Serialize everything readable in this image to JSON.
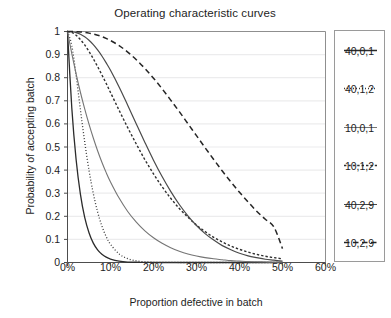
{
  "chart_data": {
    "type": "line",
    "title": "Operating characteristic curves",
    "xlabel": "Proportion defective in batch",
    "ylabel": "Probability of accepting batch",
    "xlim": [
      0,
      60
    ],
    "ylim": [
      0,
      1
    ],
    "grid": "horizontal",
    "legend_position": "right-outside",
    "xticks": [
      "0%",
      "10%",
      "20%",
      "30%",
      "40%",
      "50%",
      "60%"
    ],
    "xtick_values": [
      0,
      10,
      20,
      30,
      40,
      50,
      60
    ],
    "yticks": [
      "0",
      "0.1",
      "0.2",
      "0.3",
      "0.4",
      "0.5",
      "0.6",
      "0.7",
      "0.8",
      "0.9",
      "1"
    ],
    "ytick_values": [
      0,
      0.1,
      0.2,
      0.3,
      0.4,
      0.5,
      0.6,
      0.7,
      0.8,
      0.9,
      1
    ],
    "x": [
      0,
      1,
      2,
      3,
      4,
      5,
      6,
      7,
      8,
      9,
      10,
      12,
      14,
      16,
      18,
      20,
      22,
      24,
      26,
      28,
      30,
      32,
      34,
      36,
      38,
      40,
      42,
      44,
      46,
      48,
      50
    ],
    "series": [
      {
        "name": "40,0,1",
        "style": "solid",
        "color": "#2b2b2b",
        "width": 1.3,
        "values": [
          1.0,
          0.669,
          0.446,
          0.296,
          0.195,
          0.129,
          0.084,
          0.055,
          0.036,
          0.023,
          0.015,
          0.006,
          0.002,
          0.001,
          0.0004,
          0.0001,
          0.0,
          0.0,
          0.0,
          0.0,
          0.0,
          0.0,
          0.0,
          0.0,
          0.0,
          0.0,
          0.0,
          0.0,
          0.0,
          0.0,
          0.0
        ]
      },
      {
        "name": "40,1,2",
        "style": "dotted",
        "color": "#3a3a3a",
        "width": 1.3,
        "values": [
          1.0,
          0.939,
          0.81,
          0.662,
          0.522,
          0.399,
          0.299,
          0.219,
          0.158,
          0.112,
          0.079,
          0.037,
          0.017,
          0.007,
          0.003,
          0.001,
          0.0005,
          0.0002,
          0.0001,
          0.0,
          0.0,
          0.0,
          0.0,
          0.0,
          0.0,
          0.0,
          0.0,
          0.0,
          0.0,
          0.0,
          0.0
        ]
      },
      {
        "name": "10,0,1",
        "style": "solid",
        "color": "#757575",
        "width": 1.1,
        "values": [
          1.0,
          0.904,
          0.817,
          0.737,
          0.665,
          0.599,
          0.539,
          0.484,
          0.434,
          0.389,
          0.349,
          0.279,
          0.221,
          0.175,
          0.137,
          0.107,
          0.083,
          0.064,
          0.049,
          0.037,
          0.028,
          0.021,
          0.016,
          0.012,
          0.008,
          0.006,
          0.004,
          0.003,
          0.002,
          0.001,
          0.001
        ]
      },
      {
        "name": "10,1,2",
        "style": "dashed-fine",
        "color": "#2f2f2f",
        "width": 1.4,
        "values": [
          1.0,
          0.996,
          0.984,
          0.965,
          0.942,
          0.914,
          0.882,
          0.848,
          0.812,
          0.775,
          0.736,
          0.659,
          0.584,
          0.513,
          0.445,
          0.384,
          0.328,
          0.278,
          0.234,
          0.196,
          0.162,
          0.134,
          0.109,
          0.089,
          0.071,
          0.057,
          0.045,
          0.035,
          0.027,
          0.021,
          0.016
        ]
      },
      {
        "name": "40,2,9",
        "style": "solid",
        "color": "#4a4a4a",
        "width": 1.2,
        "values": [
          1.0,
          0.999,
          0.995,
          0.988,
          0.977,
          0.962,
          0.943,
          0.92,
          0.894,
          0.864,
          0.832,
          0.76,
          0.681,
          0.6,
          0.52,
          0.443,
          0.372,
          0.308,
          0.251,
          0.202,
          0.16,
          0.125,
          0.097,
          0.073,
          0.055,
          0.04,
          0.029,
          0.021,
          0.014,
          0.01,
          0.006
        ]
      },
      {
        "name": "10,2,9",
        "style": "dashed",
        "color": "#252525",
        "width": 1.5,
        "values": [
          1.0,
          1.0,
          0.999,
          0.998,
          0.996,
          0.993,
          0.989,
          0.984,
          0.978,
          0.97,
          0.961,
          0.939,
          0.911,
          0.878,
          0.84,
          0.798,
          0.752,
          0.703,
          0.653,
          0.601,
          0.549,
          0.497,
          0.446,
          0.396,
          0.349,
          0.304,
          0.262,
          0.222,
          0.187,
          0.154,
          0.06
        ]
      }
    ]
  },
  "legend": {
    "items": [
      {
        "label": "40,0,1"
      },
      {
        "label": "40,1,2"
      },
      {
        "label": "10,0,1"
      },
      {
        "label": "10,1,2"
      },
      {
        "label": "40,2,9"
      },
      {
        "label": "10,2,9"
      }
    ]
  },
  "colors": {
    "grid": "#ececed",
    "axis": "#4d4d4d",
    "legend_border": "#9a9a9a",
    "text": "#1d1d1d",
    "background": "#ffffff"
  }
}
